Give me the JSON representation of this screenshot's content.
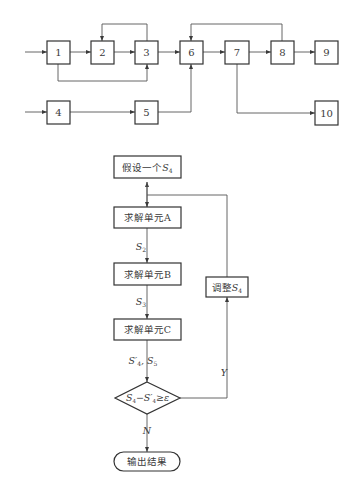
{
  "block_diagram": {
    "blocks": [
      {
        "id": "1",
        "label": "1"
      },
      {
        "id": "2",
        "label": "2"
      },
      {
        "id": "3",
        "label": "3"
      },
      {
        "id": "4",
        "label": "4"
      },
      {
        "id": "5",
        "label": "5"
      },
      {
        "id": "6",
        "label": "6"
      },
      {
        "id": "7",
        "label": "7"
      },
      {
        "id": "8",
        "label": "8"
      },
      {
        "id": "9",
        "label": "9"
      },
      {
        "id": "10",
        "label": "10"
      }
    ],
    "connections": [
      "in->1",
      "1->2",
      "2->3",
      "3->2 (feedback)",
      "1->3 (bypass)",
      "3->6",
      "in->4",
      "4->5",
      "5->6",
      "6->7",
      "7->8",
      "8->6 (feedback)",
      "8->9",
      "7->10"
    ]
  },
  "flowchart": {
    "start": "假设一个",
    "start_var": "S",
    "start_sub": "4",
    "step_a": "求解单元A",
    "label_s2": "S",
    "label_s2_sub": "2",
    "step_b": "求解单元B",
    "label_s3": "S",
    "label_s3_sub": "3",
    "step_c": "求解单元C",
    "label_out_c": "S′",
    "label_out_c_sub": "4",
    "label_out_c_sep": ", ",
    "label_out_c2": "S",
    "label_out_c2_sub": "5",
    "decision": "S₄−S′₄ ≥ ε",
    "decision_parts": {
      "a": "S",
      "a_sub": "4",
      "minus": "−",
      "b": "S′",
      "b_sub": "4",
      "op": "≥",
      "eps": "ε"
    },
    "yes_label": "Y",
    "no_label": "N",
    "adjust": "调整",
    "adjust_var": "S",
    "adjust_sub": "4",
    "end": "输出结果"
  }
}
